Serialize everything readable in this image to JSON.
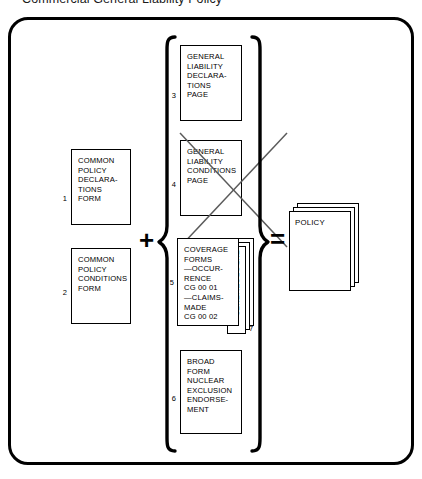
{
  "title": "Commercial General Liability Policy",
  "caption": "",
  "operators": {
    "plus": "+",
    "equals": "="
  },
  "left_column": [
    {
      "number": "1",
      "name": "common-policy-declarations-form",
      "lines": [
        "COMMON",
        "POLICY",
        "DECLARA-",
        "TIONS",
        "FORM"
      ]
    },
    {
      "number": "2",
      "name": "common-policy-conditions-form",
      "lines": [
        "COMMON",
        "POLICY",
        "CONDITIONS",
        "FORM"
      ]
    }
  ],
  "braced_column": [
    {
      "number": "3",
      "name": "general-liability-declarations-page",
      "lines": [
        "GENERAL",
        "LIABILITY",
        "DECLARA-",
        "TIONS",
        "PAGE"
      ]
    },
    {
      "number": "4",
      "name": "general-liability-conditions-page",
      "lines": [
        "GENERAL",
        "LIABILITY",
        "CONDITIONS",
        "PAGE"
      ],
      "struck_out": true
    },
    {
      "number": "5",
      "name": "coverage-forms",
      "lines": [
        "COVERAGE",
        "FORMS",
        "—OCCUR-",
        "RENCE",
        "CG 00 01",
        "—CLAIMS-",
        "MADE",
        "CG 00 02"
      ]
    },
    {
      "number": "6",
      "name": "broad-form-nuclear-exclusion-endorsement",
      "lines": [
        "BROAD",
        "FORM",
        "NUCLEAR",
        "EXCLUSION",
        "ENDORSE-",
        "MENT"
      ]
    }
  ],
  "endorsements": {
    "number": "7",
    "label": "ENDORSEMENTS"
  },
  "result": {
    "name": "policy-stack",
    "label": "POLICY"
  }
}
